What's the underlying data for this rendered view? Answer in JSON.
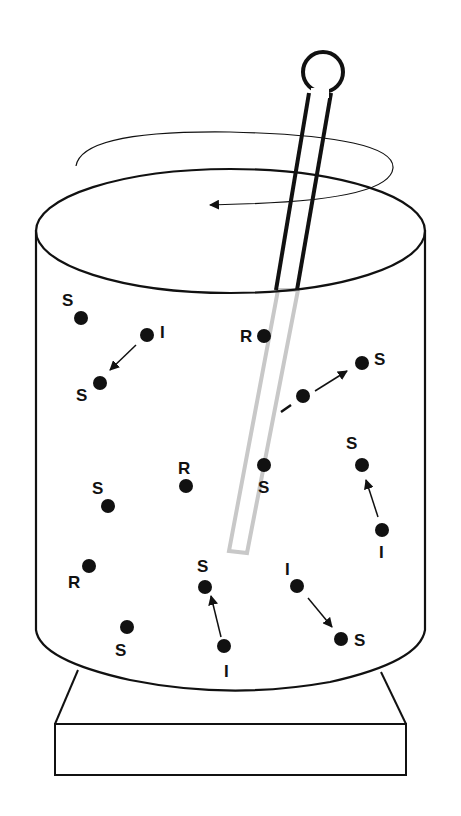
{
  "diagram": {
    "colors": {
      "ink": "#111111",
      "submerged_rod": "#c8c8c8",
      "background": "#ffffff"
    },
    "stir_direction": "counterclockwise",
    "particles": [
      {
        "id": "p1",
        "label": "S"
      },
      {
        "id": "p2",
        "label": "I"
      },
      {
        "id": "p3",
        "label": "S"
      },
      {
        "id": "p4",
        "label": "R"
      },
      {
        "id": "p5",
        "label": "I"
      },
      {
        "id": "p6",
        "label": "S"
      },
      {
        "id": "p7",
        "label": "R"
      },
      {
        "id": "p8",
        "label": "S"
      },
      {
        "id": "p9",
        "label": "S"
      },
      {
        "id": "p10",
        "label": "S"
      },
      {
        "id": "p11",
        "label": "I"
      },
      {
        "id": "p12",
        "label": "R"
      },
      {
        "id": "p13",
        "label": "S"
      },
      {
        "id": "p14",
        "label": "I"
      },
      {
        "id": "p15",
        "label": "I"
      },
      {
        "id": "p16",
        "label": "S"
      },
      {
        "id": "p17",
        "label": "S"
      }
    ],
    "transitions": [
      {
        "from": "I",
        "to": "S"
      },
      {
        "from": "I",
        "to": "S"
      },
      {
        "from": "I",
        "to": "S"
      },
      {
        "from": "I",
        "to": "S"
      },
      {
        "from": "I",
        "to": "S"
      }
    ]
  }
}
